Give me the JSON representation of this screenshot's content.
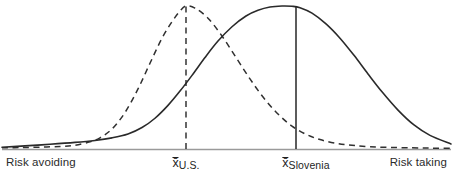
{
  "chart_data": {
    "type": "line",
    "title": "",
    "title_visible": false,
    "xlabel": "",
    "ylabel": "",
    "grid": false,
    "legend_position": "none",
    "xlim": [
      0,
      453
    ],
    "ylim": [
      0,
      1
    ],
    "axis_endpoint_labels": {
      "left": "Risk avoiding",
      "right": "Risk taking"
    },
    "annotations": [
      {
        "name": "mean-us",
        "x": 186,
        "symbol": "x̄",
        "subscript": "U.S.",
        "line_style": "dashed"
      },
      {
        "name": "mean-slovenia",
        "x": 296,
        "symbol": "x̄",
        "subscript": "Slovenia",
        "line_style": "solid"
      }
    ],
    "series": [
      {
        "name": "U.S.",
        "style": "dashed",
        "color": "#303030",
        "mean_x": 186,
        "peak_height": 1.0,
        "sigma": 52,
        "points_x": [
          2,
          20,
          40,
          60,
          75,
          90,
          100,
          112,
          125,
          138,
          150,
          162,
          172,
          180,
          186,
          195,
          208,
          222,
          236,
          250,
          264,
          278,
          292,
          306,
          320,
          336,
          352,
          370,
          390,
          412,
          432,
          451
        ],
        "points_y": [
          0.008,
          0.01,
          0.013,
          0.018,
          0.026,
          0.05,
          0.078,
          0.14,
          0.255,
          0.42,
          0.6,
          0.775,
          0.89,
          0.965,
          1.0,
          0.985,
          0.915,
          0.79,
          0.64,
          0.49,
          0.355,
          0.245,
          0.16,
          0.103,
          0.066,
          0.04,
          0.026,
          0.016,
          0.011,
          0.008,
          0.006,
          0.005
        ]
      },
      {
        "name": "Slovenia",
        "style": "solid",
        "color": "#2a2a2a",
        "mean_x": 296,
        "peak_height": 1.0,
        "sigma": 66,
        "points_x": [
          2,
          25,
          50,
          75,
          95,
          112,
          128,
          142,
          155,
          168,
          180,
          192,
          205,
          218,
          232,
          246,
          258,
          270,
          282,
          292,
          300,
          312,
          326,
          340,
          354,
          368,
          382,
          398,
          414,
          430,
          451
        ],
        "points_y": [
          0.012,
          0.022,
          0.033,
          0.046,
          0.06,
          0.078,
          0.105,
          0.15,
          0.215,
          0.305,
          0.405,
          0.515,
          0.64,
          0.755,
          0.855,
          0.93,
          0.97,
          0.993,
          1.0,
          0.998,
          0.988,
          0.95,
          0.875,
          0.775,
          0.655,
          0.525,
          0.4,
          0.272,
          0.168,
          0.095,
          0.035
        ]
      }
    ],
    "axis_line": {
      "y": 149,
      "color": "#9a9a9a",
      "thickness": 1
    }
  },
  "labels": {
    "risk_avoiding": "Risk avoiding",
    "risk_taking": "Risk taking",
    "mean_symbol": "x̄",
    "mean_us_subscript": "U.S.",
    "mean_slovenia_subscript": "Slovenia"
  },
  "colors": {
    "curve_solid": "#2a2a2a",
    "curve_dashed": "#303030",
    "axis": "#9a9a9a",
    "text": "#2b2b2b",
    "background": "#ffffff"
  }
}
